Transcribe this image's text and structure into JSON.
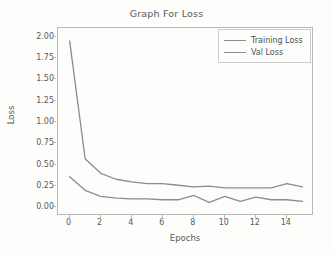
{
  "chart_data": {
    "type": "line",
    "title": "Graph For Loss",
    "xlabel": "Epochs",
    "ylabel": "Loss",
    "grid": false,
    "legend_position": "upper right",
    "x": [
      0,
      1,
      2,
      3,
      4,
      5,
      6,
      7,
      8,
      9,
      10,
      11,
      12,
      13,
      14,
      15
    ],
    "xlim": [
      -0.75,
      15.75
    ],
    "ylim": [
      -0.1,
      2.1
    ],
    "xticks": [
      0,
      2,
      4,
      6,
      8,
      10,
      12,
      14
    ],
    "xtick_labels": [
      "0",
      "2",
      "4",
      "6",
      "8",
      "10",
      "12",
      "14"
    ],
    "yticks": [
      0.0,
      0.25,
      0.5,
      0.75,
      1.0,
      1.25,
      1.5,
      1.75,
      2.0
    ],
    "ytick_labels": [
      "0.00",
      "0.25",
      "0.50",
      "0.75",
      "1.00",
      "1.25",
      "1.50",
      "1.75",
      "2.00"
    ],
    "series": [
      {
        "name": "Training Loss",
        "color": "#8c8c8c",
        "values": [
          0.36,
          0.2,
          0.13,
          0.11,
          0.1,
          0.1,
          0.09,
          0.09,
          0.14,
          0.06,
          0.13,
          0.07,
          0.12,
          0.09,
          0.09,
          0.07
        ]
      },
      {
        "name": "Val Loss",
        "color": "#8c8c8c",
        "values": [
          1.95,
          0.57,
          0.4,
          0.33,
          0.3,
          0.28,
          0.28,
          0.26,
          0.24,
          0.25,
          0.23,
          0.23,
          0.23,
          0.23,
          0.28,
          0.24
        ]
      }
    ]
  },
  "legend": {
    "items": [
      {
        "label": "Training Loss"
      },
      {
        "label": "Val Loss"
      }
    ]
  },
  "axes": {
    "title": "Graph For Loss",
    "xlabel": "Epochs",
    "ylabel": "Loss"
  },
  "colors": {
    "line": "#8c8c8c",
    "axis": "#b9b9b9",
    "text": "#5a5a5a",
    "background": "#fdfdfc"
  }
}
